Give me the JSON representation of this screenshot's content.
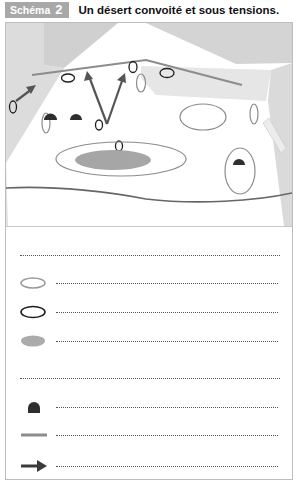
{
  "header": {
    "badge_label": "Schéma",
    "badge_number": "2",
    "title": "Un désert convoité et sous tensions."
  },
  "colors": {
    "badge_bg": "#a8a8a8",
    "map_gray_dark": "#d2d2d2",
    "map_gray_light": "#e4e4e4",
    "line_gray": "#8c8c8c",
    "ellipse_dark": "#1e1e1e",
    "filled_gray": "#a6a6a6"
  },
  "legend": {
    "rows": [
      {
        "symbol": "blank-title-line",
        "text": ""
      },
      {
        "symbol": "gray-outline-ellipse-icon",
        "text": ""
      },
      {
        "symbol": "black-outline-ellipse-icon",
        "text": ""
      },
      {
        "symbol": "gray-filled-ellipse-icon",
        "text": ""
      },
      {
        "symbol": "blank-title-line",
        "text": ""
      },
      {
        "symbol": "dark-dome-icon",
        "text": ""
      },
      {
        "symbol": "gray-line-icon",
        "text": ""
      },
      {
        "symbol": "arrow-right-icon",
        "text": ""
      }
    ]
  }
}
